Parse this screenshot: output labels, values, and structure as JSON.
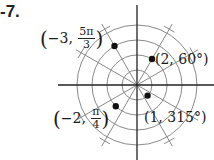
{
  "exercise_number": "-7.",
  "graph": {
    "type": "polar-grid",
    "center_px": [
      137,
      85
    ],
    "unit_px": 15,
    "circle_radii": [
      1,
      2,
      3,
      4
    ],
    "radial_line_step_deg": 30,
    "line_color": "#8a8a8a",
    "axis_color": "#222222",
    "point_color": "#111111"
  },
  "points": [
    {
      "label_prefix": "(−3, ",
      "frac_num": "5π",
      "frac_den": "3",
      "label_suffix": ")",
      "r": -3,
      "theta": "5π/3",
      "theta_deg": 300
    },
    {
      "label": "(2, 60°)",
      "r": 2,
      "theta": "60°",
      "theta_deg": 60
    },
    {
      "label_prefix": "(−2, ",
      "frac_num": "π",
      "frac_den": "4",
      "label_suffix": ")",
      "r": -2,
      "theta": "π/4",
      "theta_deg": 45
    },
    {
      "label": "(1, 315°)",
      "r": 1,
      "theta": "315°",
      "theta_deg": 315
    }
  ]
}
